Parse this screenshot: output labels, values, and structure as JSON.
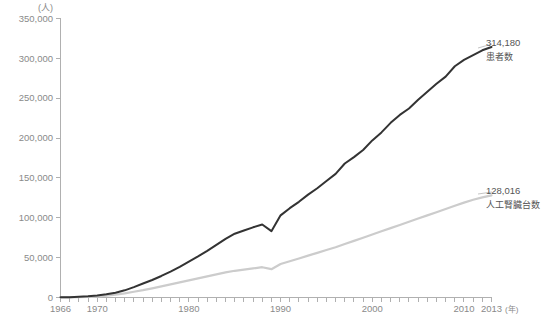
{
  "chart_data": {
    "type": "line",
    "title": "",
    "subtitle": "",
    "xlabel": "年",
    "ylabel": "(人)",
    "xlim": [
      1966,
      2013
    ],
    "ylim": [
      0,
      350000
    ],
    "grid": false,
    "legend_position": "right-inline-annotations",
    "y_ticks": [
      0,
      50000,
      100000,
      150000,
      200000,
      250000,
      300000,
      350000
    ],
    "y_tick_labels": [
      "0",
      "50,000",
      "100,000",
      "150,000",
      "200,000",
      "250,000",
      "300,000",
      "350,000"
    ],
    "x_ticks": [
      1966,
      1970,
      1980,
      1990,
      2000,
      2010,
      2013
    ],
    "x_tick_labels": [
      "1966",
      "1970",
      "1980",
      "1990",
      "2000",
      "2010",
      "2013"
    ],
    "x_minor_tick_interval": 1,
    "x": [
      1966,
      1967,
      1968,
      1969,
      1970,
      1971,
      1972,
      1973,
      1974,
      1975,
      1976,
      1977,
      1978,
      1979,
      1980,
      1981,
      1982,
      1983,
      1984,
      1985,
      1986,
      1987,
      1988,
      1989,
      1990,
      1991,
      1992,
      1993,
      1994,
      1995,
      1996,
      1997,
      1998,
      1999,
      2000,
      2001,
      2002,
      2003,
      2004,
      2005,
      2006,
      2007,
      2008,
      2009,
      2010,
      2011,
      2012,
      2013
    ],
    "series": [
      {
        "name": "患者数",
        "color": "#333333",
        "end_label_value": "314,180",
        "end_label_name": "患者数",
        "values": [
          215,
          450,
          880,
          1500,
          2500,
          4000,
          6000,
          9000,
          13000,
          17500,
          22000,
          27000,
          32500,
          38500,
          45000,
          51500,
          58500,
          66000,
          73500,
          80000,
          84000,
          88000,
          91500,
          83200,
          103000,
          112000,
          120000,
          129000,
          137000,
          146000,
          155000,
          168000,
          176000,
          185000,
          197000,
          207000,
          219000,
          229000,
          237000,
          248000,
          258000,
          268000,
          277000,
          290000,
          298000,
          304000,
          310000,
          314180
        ]
      },
      {
        "name": "人工腎臓台数",
        "color": "#cccccc",
        "end_label_value": "128,016",
        "end_label_name": "人工腎臓台数",
        "values": [
          120,
          260,
          500,
          900,
          1500,
          2400,
          3600,
          5200,
          7200,
          9200,
          11500,
          14000,
          16500,
          19000,
          21500,
          24000,
          26500,
          29000,
          31500,
          33500,
          35000,
          36500,
          38000,
          35500,
          42000,
          45500,
          49000,
          52500,
          56000,
          59500,
          63000,
          67000,
          71000,
          75000,
          79000,
          83000,
          87000,
          91000,
          95000,
          99000,
          103000,
          107000,
          111000,
          115000,
          119000,
          122500,
          125500,
          128016
        ]
      }
    ]
  },
  "annotations": {
    "patients": {
      "value": "314,180",
      "label": "患者数"
    },
    "machines": {
      "value": "128,016",
      "label": "人工腎臓台数"
    }
  },
  "axes": {
    "y_unit": "(人)",
    "x_unit": "(年)"
  }
}
